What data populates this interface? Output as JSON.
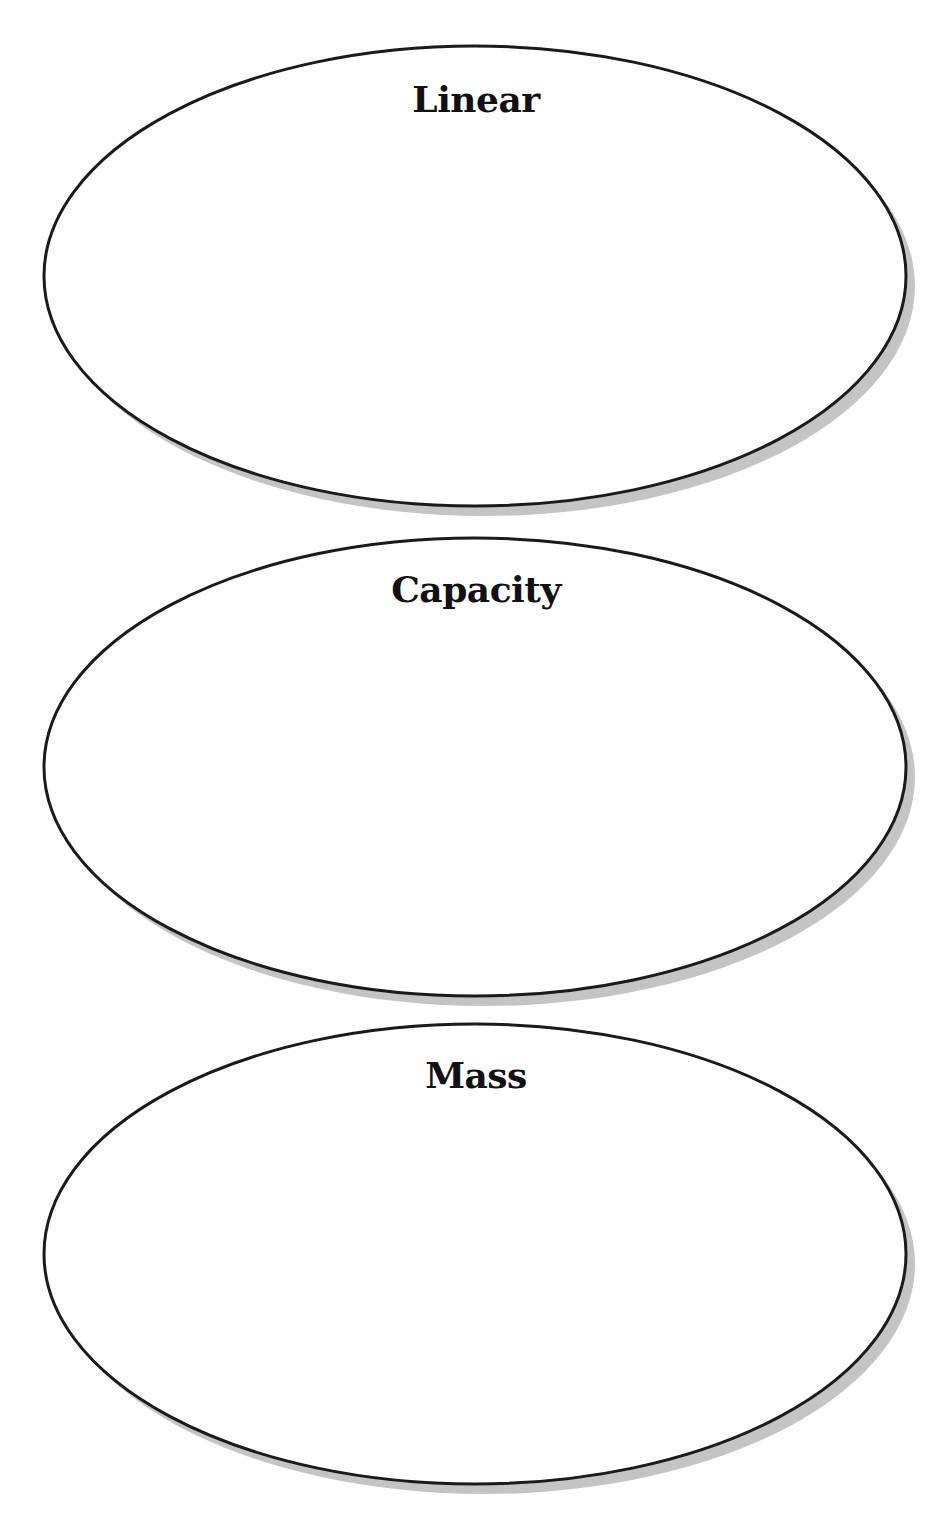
{
  "diagram": {
    "type": "stacked-oval-graphic-organizer",
    "colors": {
      "outline": "#1a1a1a",
      "shadow": "#c4c4c4",
      "fill": "#ffffff",
      "text": "#111111"
    },
    "ovals": [
      {
        "label": "Linear",
        "cx": 475,
        "cy": 276,
        "rx": 431,
        "ry": 230,
        "label_top": 80
      },
      {
        "label": "Capacity",
        "cx": 475,
        "cy": 767,
        "rx": 431,
        "ry": 229,
        "label_top": 570
      },
      {
        "label": "Mass",
        "cx": 475,
        "cy": 1254,
        "rx": 431,
        "ry": 230,
        "label_top": 1055
      }
    ]
  }
}
